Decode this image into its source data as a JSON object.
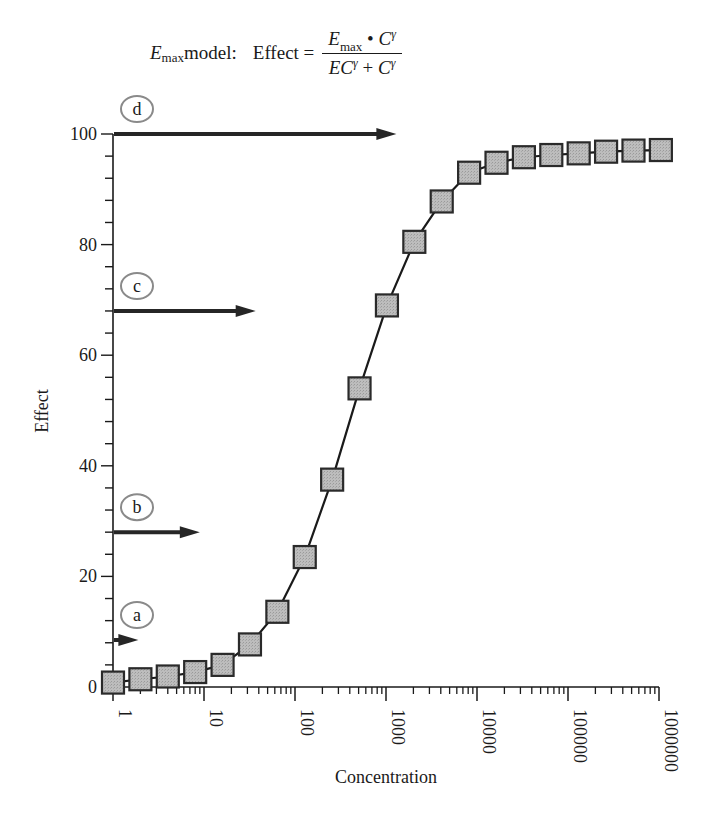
{
  "formula": {
    "prefix_var": "E",
    "prefix_sub": "max",
    "prefix_text": " model:",
    "lhs": "Effect =",
    "numerator_var": "E",
    "numerator_sub": "max",
    "numerator_op": " • ",
    "numerator_c": "C",
    "gamma": "γ",
    "denominator_ec": "EC",
    "denominator_op": " + ",
    "denominator_c": "C"
  },
  "chart_data": {
    "type": "line",
    "xlabel": "Concentration",
    "ylabel": "Effect",
    "xscale": "log",
    "xlim": [
      1,
      1000000
    ],
    "ylim": [
      0,
      100
    ],
    "x_ticks": [
      "1",
      "10",
      "100",
      "1000",
      "10000",
      "100000",
      "1000000"
    ],
    "y_ticks": [
      "0",
      "20",
      "40",
      "60",
      "80",
      "100"
    ],
    "y_minor_step": 4,
    "grid": false,
    "legend": null,
    "marker": "square",
    "marker_fill": "#b8b8b8",
    "marker_edge": "#2a2a2a",
    "line_color": "#1a1a1a",
    "series": [
      {
        "name": "Effect",
        "x": [
          1,
          2,
          4,
          8,
          16,
          32,
          64,
          128,
          256,
          512,
          1024,
          2048,
          4096,
          8192,
          16384,
          32768,
          65536,
          131072,
          262144,
          524288,
          1048576
        ],
        "values": [
          0.8,
          1.4,
          1.9,
          2.7,
          4.0,
          7.7,
          13.6,
          23.5,
          37.5,
          54.0,
          69.0,
          80.5,
          87.8,
          93.0,
          94.8,
          95.8,
          96.2,
          96.5,
          96.8,
          97.0,
          97.1
        ]
      }
    ],
    "annotations": [
      {
        "label": "a",
        "y": 8.5,
        "arrow_to_x": 1.9
      },
      {
        "label": "b",
        "y": 28.0,
        "arrow_to_x": 9.0
      },
      {
        "label": "c",
        "y": 68.0,
        "arrow_to_x": 37
      },
      {
        "label": "d",
        "y": 100.0,
        "arrow_to_x": 1300
      }
    ]
  }
}
